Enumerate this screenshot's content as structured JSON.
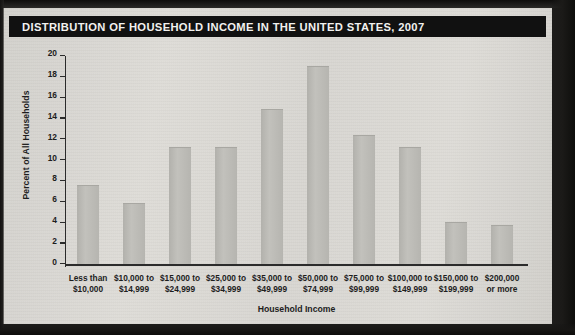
{
  "figure": {
    "title": "DISTRIBUTION OF HOUSEHOLD INCOME IN THE UNITED STATES, 2007",
    "title_bar_color": "#111111",
    "title_text_color": "#f2f1ef",
    "bar_color": "#bbbab5",
    "axis_color": "#2b2b2b",
    "page_color": "#dddbd6"
  },
  "chart_data": {
    "type": "bar",
    "title": "DISTRIBUTION OF HOUSEHOLD INCOME IN THE UNITED STATES, 2007",
    "xlabel": "Household Income",
    "ylabel": "Percent of All Households",
    "ylim": [
      0,
      20
    ],
    "ytick_step": 2,
    "yticks": [
      0,
      2,
      4,
      6,
      8,
      10,
      12,
      14,
      16,
      18,
      20
    ],
    "ytick_labels": [
      "0",
      "2",
      "4",
      "6",
      "8",
      "10",
      "12",
      "14",
      "16",
      "18",
      "20"
    ],
    "grid": false,
    "legend": "none",
    "categories": [
      "Less than\n$10,000",
      "$10,000 to\n$14,999",
      "$15,000 to\n$24,999",
      "$25,000 to\n$34,999",
      "$35,000 to\n$49,999",
      "$50,000 to\n$74,999",
      "$75,000 to\n$99,999",
      "$100,000 to\n$149,999",
      "$150,000 to\n$199,999",
      "$200,000\nor more"
    ],
    "category_lines": [
      [
        "Less than",
        "$10,000"
      ],
      [
        "$10,000 to",
        "$14,999"
      ],
      [
        "$15,000 to",
        "$24,999"
      ],
      [
        "$25,000 to",
        "$34,999"
      ],
      [
        "$35,000 to",
        "$49,999"
      ],
      [
        "$50,000 to",
        "$74,999"
      ],
      [
        "$75,000 to",
        "$99,999"
      ],
      [
        "$100,000 to",
        "$149,999"
      ],
      [
        "$150,000 to",
        "$199,999"
      ],
      [
        "$200,000",
        "or more"
      ]
    ],
    "values": [
      7.5,
      5.8,
      11.2,
      11.2,
      14.8,
      18.9,
      12.3,
      11.2,
      4.0,
      3.7
    ]
  }
}
